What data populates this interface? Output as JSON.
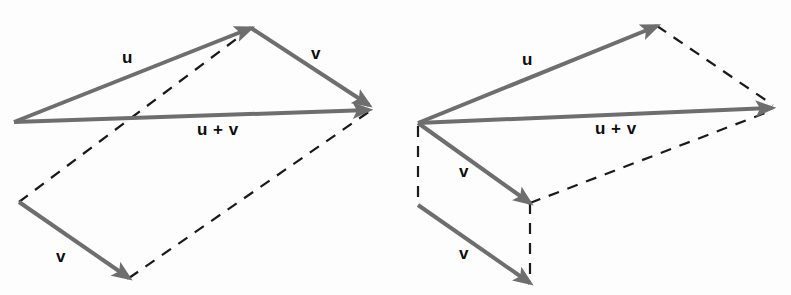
{
  "figure": {
    "background_color": "#fdfdfd",
    "solid_vector_color": "#6e6e6e",
    "dashed_line_color": "#1a1a1a",
    "label_color": "#0d0d0d",
    "solid_stroke_width": 4,
    "dashed_stroke_width": 2.2,
    "dash_pattern": "11 9"
  },
  "diagrams": [
    {
      "id": "left-parallelogram",
      "name": "parallelogram-rule-diagram",
      "labels": [
        {
          "id": "left-u",
          "text": "u",
          "x": 122,
          "y": 63
        },
        {
          "id": "left-v-top",
          "text": "v",
          "x": 311,
          "y": 59
        },
        {
          "id": "left-sum",
          "text": "u + v",
          "x": 197,
          "y": 135
        },
        {
          "id": "left-v-bottom",
          "text": "v",
          "x": 56,
          "y": 262
        }
      ],
      "vectors": [
        {
          "id": "left-u-arrow",
          "label": "u",
          "x1": 14,
          "y1": 122,
          "x2": 251,
          "y2": 28
        },
        {
          "id": "left-v-top-arrow",
          "label": "v",
          "x1": 251,
          "y1": 28,
          "x2": 369,
          "y2": 105
        },
        {
          "id": "left-sum-arrow",
          "label": "u + v",
          "x1": 14,
          "y1": 122,
          "x2": 369,
          "y2": 110
        },
        {
          "id": "left-v-bottom-arrow",
          "label": "v",
          "x1": 19,
          "y1": 202,
          "x2": 129,
          "y2": 278
        }
      ],
      "dashed_lines": [
        {
          "id": "left-dash-diagonal",
          "x1": 19,
          "y1": 202,
          "x2": 251,
          "y2": 28
        },
        {
          "id": "left-dash-lower-right",
          "x1": 129,
          "y1": 278,
          "x2": 370,
          "y2": 111
        }
      ]
    },
    {
      "id": "right-triangle",
      "name": "triangle-rule-diagram",
      "labels": [
        {
          "id": "right-u",
          "text": "u",
          "x": 522,
          "y": 65
        },
        {
          "id": "right-sum",
          "text": "u + v",
          "x": 595,
          "y": 134
        },
        {
          "id": "right-v-upper",
          "text": "v",
          "x": 459,
          "y": 177
        },
        {
          "id": "right-v-lower",
          "text": "v",
          "x": 459,
          "y": 259
        }
      ],
      "vectors": [
        {
          "id": "right-u-arrow",
          "label": "u",
          "x1": 418,
          "y1": 123,
          "x2": 657,
          "y2": 26
        },
        {
          "id": "right-sum-arrow",
          "label": "u + v",
          "x1": 418,
          "y1": 123,
          "x2": 772,
          "y2": 108
        },
        {
          "id": "right-v-upper-arrow",
          "label": "v",
          "x1": 418,
          "y1": 123,
          "x2": 530,
          "y2": 203
        },
        {
          "id": "right-v-lower-arrow",
          "label": "v",
          "x1": 418,
          "y1": 205,
          "x2": 530,
          "y2": 283
        }
      ],
      "dashed_lines": [
        {
          "id": "right-dash-top",
          "x1": 657,
          "y1": 26,
          "x2": 773,
          "y2": 105
        },
        {
          "id": "right-dash-diagonal",
          "x1": 530,
          "y1": 203,
          "x2": 773,
          "y2": 110
        },
        {
          "id": "right-dash-left-vertical",
          "x1": 418,
          "y1": 126,
          "x2": 418,
          "y2": 206
        },
        {
          "id": "right-dash-mid-vertical",
          "x1": 530,
          "y1": 203,
          "x2": 530,
          "y2": 284
        }
      ]
    }
  ]
}
